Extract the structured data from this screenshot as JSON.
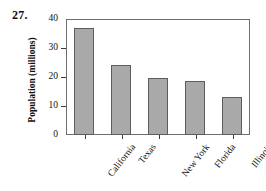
{
  "problem": {
    "number": "27."
  },
  "chart_data": {
    "type": "bar",
    "title": "",
    "xlabel": "",
    "ylabel": "Population (millions)",
    "ylim": [
      0,
      40
    ],
    "yticks": [
      0,
      10,
      20,
      30,
      40
    ],
    "ytick_labels": [
      "0",
      "10",
      "20",
      "30",
      "40"
    ],
    "grid": false,
    "legend": null,
    "categories": [
      "California",
      "Texas",
      "New York",
      "Florida",
      "Illinois"
    ],
    "values": [
      37,
      24,
      19.5,
      18.5,
      13
    ],
    "bar_color": "#a9a9a9",
    "bar_edge_color": "#5d5d5d",
    "axis_color": "#6e6e6e",
    "text_color": "#111111"
  }
}
